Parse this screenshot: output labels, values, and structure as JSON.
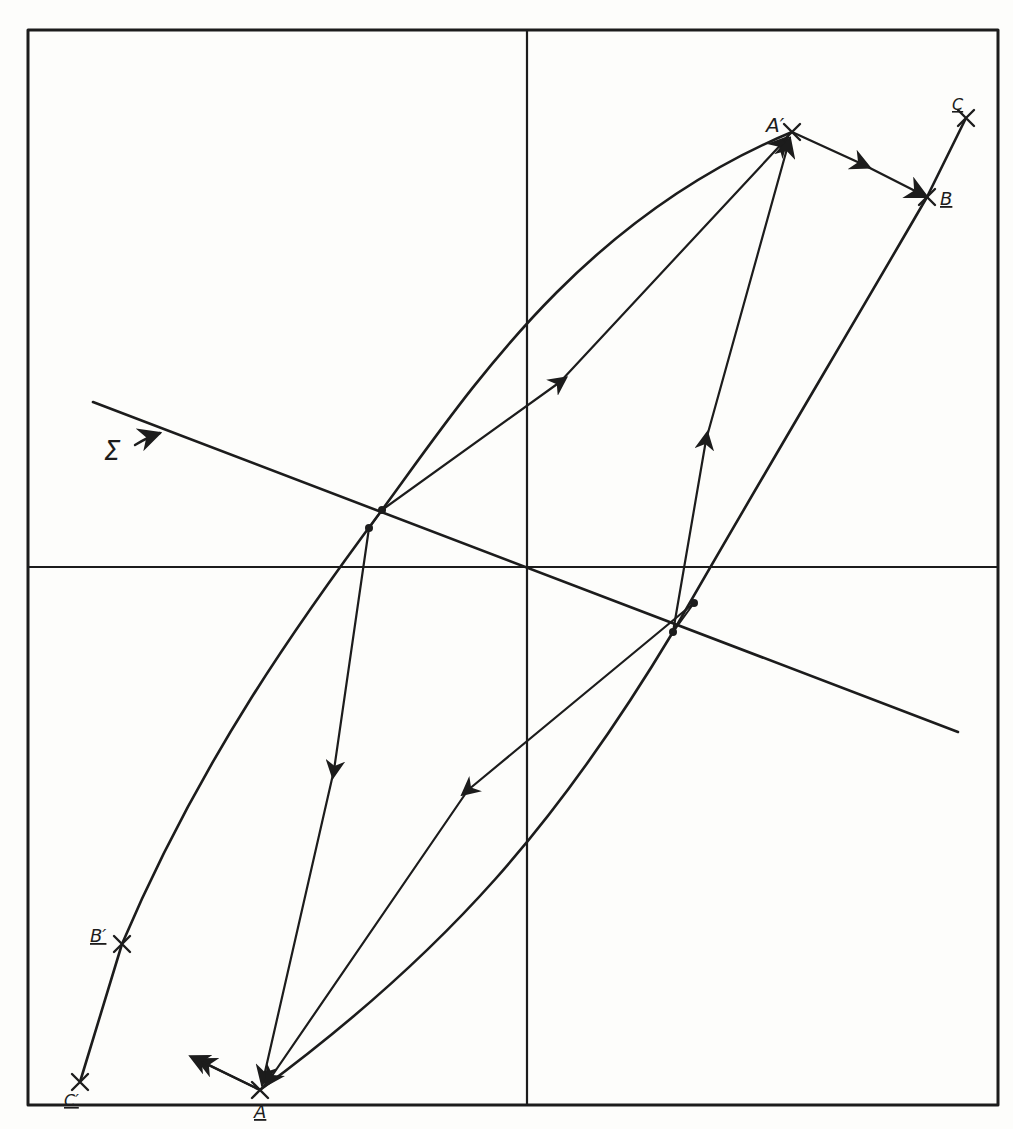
{
  "diagram": {
    "type": "hand-drawn geometric construction",
    "labels": {
      "A_prime": "A′",
      "B": "B",
      "C": "C",
      "A": "A",
      "B_prime": "B′",
      "C_prime": "C′",
      "sigma": "Σ"
    },
    "colors": {
      "ink": "#1c1c1c",
      "paper": "#fdfdfb"
    },
    "points": {
      "A_prime": [
        792,
        132
      ],
      "B": [
        927,
        197
      ],
      "C": [
        966,
        118
      ],
      "A": [
        260,
        1090
      ],
      "B_prime": [
        122,
        944
      ],
      "C_prime": [
        80,
        1082
      ],
      "upper_intersection_1": [
        382,
        510
      ],
      "upper_intersection_2": [
        369,
        528
      ],
      "lower_intersection_1": [
        694,
        603
      ],
      "lower_intersection_2": [
        673,
        632
      ]
    },
    "axes": {
      "vertical_x": 527,
      "horizontal_y": 567
    },
    "frame": {
      "left": 28,
      "top": 30,
      "right": 998,
      "bottom": 1105
    }
  }
}
